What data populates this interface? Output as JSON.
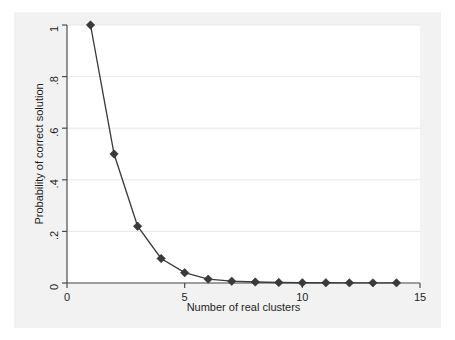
{
  "figure": {
    "background_color": "#ffffff",
    "panel_color": "#f2f2f2",
    "plot_background_color": "#ffffff"
  },
  "chart_data": {
    "type": "line",
    "title": "",
    "subtitle": "",
    "xlabel": "Number of real clusters",
    "ylabel": "Probability of correct solution",
    "x": [
      1,
      2,
      3,
      4,
      5,
      6,
      7,
      8,
      9,
      10,
      11,
      12,
      13,
      14
    ],
    "values": [
      1.0,
      0.5,
      0.22,
      0.095,
      0.04,
      0.015,
      0.007,
      0.004,
      0.002,
      0.001,
      0.001,
      0.0005,
      0.0005,
      0.0005
    ],
    "series": [
      {
        "name": "Probability of correct solution",
        "values": [
          1.0,
          0.5,
          0.22,
          0.095,
          0.04,
          0.015,
          0.007,
          0.004,
          0.002,
          0.001,
          0.001,
          0.0005,
          0.0005,
          0.0005
        ],
        "line_color": "#3c3c3c",
        "marker": "diamond",
        "marker_color": "#3a3a3a"
      }
    ],
    "xlim": [
      0,
      15
    ],
    "ylim": [
      0,
      1
    ],
    "xticks": [
      0,
      5,
      10,
      15
    ],
    "xticklabels": [
      "0",
      "5",
      "10",
      "15"
    ],
    "yticks": [
      0,
      0.2,
      0.4,
      0.6,
      0.8,
      1
    ],
    "yticklabels": [
      "0",
      ".2",
      ".4",
      ".6",
      ".8",
      "1"
    ],
    "grid": "horizontal",
    "legend": "none",
    "annotations": []
  }
}
